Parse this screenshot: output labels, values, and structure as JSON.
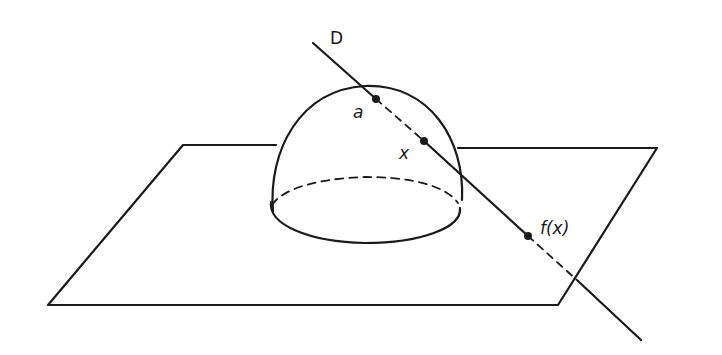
{
  "diagram": {
    "labels": {
      "line": "D",
      "point_a": "a",
      "point_x": "x",
      "point_fx": "f(x)"
    },
    "colors": {
      "stroke": "#1a1a1a",
      "background": "#ffffff"
    }
  }
}
